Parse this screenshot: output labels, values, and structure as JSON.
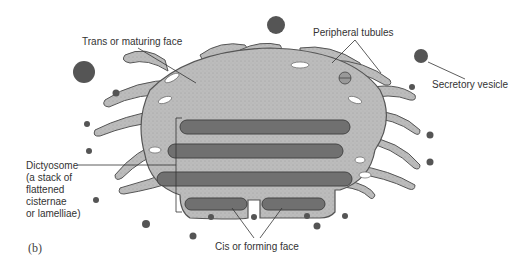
{
  "figure": {
    "panel_label": "(b)",
    "colors": {
      "body_fill": "#b9b9b9",
      "body_stroke": "#555555",
      "cisterna_fill": "#6e6e6e",
      "vesicle_fill": "#555555",
      "leader_line": "#333333",
      "background": "#ffffff"
    }
  },
  "labels": {
    "trans_face": "Trans or maturing face",
    "peripheral_tubules": "Peripheral tubules",
    "secretory_vesicle": "Secretory vesicle",
    "dictyosome": "Dictyosome\n(a stack of\nflattened\ncisternae\nor lamelliae)",
    "cis_face": "Cis or forming face"
  }
}
